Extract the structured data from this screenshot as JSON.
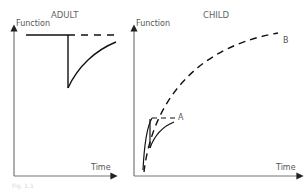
{
  "panels": [
    {
      "title": "ADULT",
      "y_axis_label": "Function",
      "x_axis_label": "Time"
    },
    {
      "title": "CHILD",
      "y_axis_label": "Function",
      "x_axis_label": "Time",
      "curve_labels": [
        "A",
        "B"
      ]
    }
  ],
  "caption": "Fig. 1.1",
  "colors": {
    "axis": "#7a7a7a",
    "curve": "#1a1a1a"
  }
}
